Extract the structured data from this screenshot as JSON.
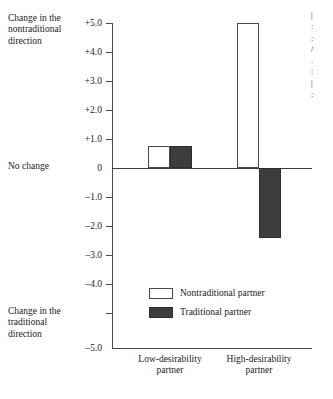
{
  "chart_data": {
    "type": "bar",
    "title": "",
    "xlabel": "",
    "ylabel": "",
    "ylim": [
      -5.0,
      5.0
    ],
    "grid": false,
    "legend_position": "inside-lower-center",
    "categories": [
      "Low-desirability partner",
      "High-desirability partner"
    ],
    "series": [
      {
        "name": "Nontraditional partner",
        "color": "#ffffff",
        "values": [
          0.75,
          5.0
        ]
      },
      {
        "name": "Traditional partner",
        "color": "#3d3d3d",
        "values": [
          0.75,
          -2.4
        ]
      }
    ],
    "y_ticks": [
      {
        "value": 5.0,
        "label": "+5.0"
      },
      {
        "value": 4.0,
        "label": "+4.0"
      },
      {
        "value": 3.0,
        "label": "+3.0"
      },
      {
        "value": 2.0,
        "label": "+2.0"
      },
      {
        "value": 1.0,
        "label": "+1.0"
      },
      {
        "value": 0.0,
        "label": "0"
      },
      {
        "value": -1.0,
        "label": "–1.0"
      },
      {
        "value": -2.0,
        "label": "–2.0"
      },
      {
        "value": -3.0,
        "label": "–3.0"
      },
      {
        "value": -4.0,
        "label": "–4.0"
      },
      {
        "value": -5.0,
        "label": "–5.0"
      }
    ],
    "annotations": {
      "top": "Change in the nontraditional direction",
      "zero": "No change",
      "bottom": "Change in the traditional direction"
    }
  },
  "legend": {
    "items": [
      {
        "label": "Nontraditional partner",
        "swatch": "light"
      },
      {
        "label": "Traditional partner",
        "swatch": "dark"
      }
    ]
  },
  "categories": {
    "low": {
      "line1": "Low-desirability",
      "line2": "partner"
    },
    "high": {
      "line1": "High-desirability",
      "line2": "partner"
    }
  },
  "y_labels": {
    "p5": "+5.0",
    "p4": "+4.0",
    "p3": "+3.0",
    "p2": "+2.0",
    "p1": "+1.0",
    "zero": "0",
    "m1": "–1.0",
    "m2": "–2.0",
    "m3": "–3.0",
    "m4": "–4.0",
    "m5": "–5.0"
  },
  "annotations": {
    "top_l1": "Change in the",
    "top_l2": "nontraditional",
    "top_l3": "direction",
    "zero": "No change",
    "bottom_l1": "Change in the",
    "bottom_l2": "traditional",
    "bottom_l3": "direction"
  }
}
